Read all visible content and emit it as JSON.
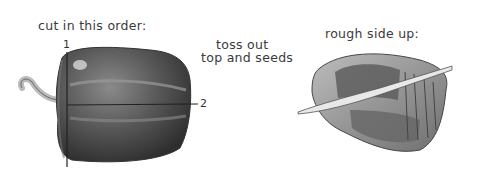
{
  "illustration": {
    "left_panel": {
      "caption": "cut in this order:",
      "cut_labels": [
        "1",
        "2"
      ],
      "subject": "whole bell pepper with cut lines"
    },
    "middle_panel": {
      "caption_line1": "toss out",
      "caption_line2": "top and seeds"
    },
    "right_panel": {
      "caption": "rough side up:",
      "subject": "pepper half, skin side up, being sliced with knife"
    },
    "colors": {
      "ink": "#3a3a3a",
      "pepper_dark": "#4a4a4a",
      "pepper_mid": "#7a7a7a",
      "highlight": "#d8d8d8",
      "background": "#ffffff"
    }
  }
}
